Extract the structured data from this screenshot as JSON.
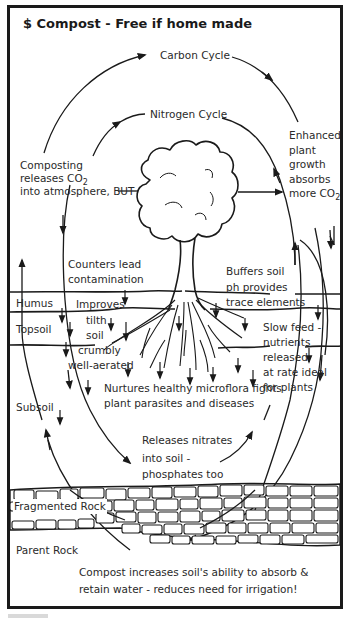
{
  "title": "$ Compost - Free if home made",
  "cycles": {
    "carbon": "Carbon Cycle",
    "nitrogen": "Nitrogen Cycle"
  },
  "annotations": {
    "composting_line1": "Composting",
    "composting_line2": "releases CO",
    "composting_sub": "2",
    "composting_line3": "into atmosphere, BUT",
    "enhanced_line1": "Enhanced",
    "enhanced_line2": "plant",
    "enhanced_line3": "growth",
    "enhanced_line4": "absorbs",
    "enhanced_line5": "more CO",
    "enhanced_sub": "2",
    "counters_line1": "Counters lead",
    "counters_line2": "contamination",
    "buffers_line1": "Buffers soil",
    "buffers_line2": "ph provides",
    "buffers_line3": "trace elements",
    "improves_line1": "Improves",
    "improves_line2": "tilth",
    "improves_line3": "soil",
    "improves_line4": "crumbly",
    "improves_line5": "well-aerated",
    "slowfeed_line1": "Slow feed -",
    "slowfeed_line2": "nutrients",
    "slowfeed_line3": "released",
    "slowfeed_line4": "at rate ideal",
    "slowfeed_line5": "for plants",
    "nurtures_line1": "Nurtures healthy microflora fights",
    "nurtures_line2": "plant parasites and diseases",
    "releases_line1": "Releases nitrates",
    "releases_line2": "into soil -",
    "releases_line3": "phosphates too",
    "footer_line1": "Compost increases soil's ability to absorb &",
    "footer_line2": "retain water - reduces need for irrigation!"
  },
  "layers": {
    "humus": "Humus",
    "topsoil": "Topsoil",
    "subsoil": "Subsoil",
    "fragmented_rock": "Fragmented Rock",
    "parent_rock": "Parent Rock"
  },
  "colors": {
    "ink": "#1a1a1a",
    "text": "#2a2a2a",
    "background": "#ffffff"
  }
}
